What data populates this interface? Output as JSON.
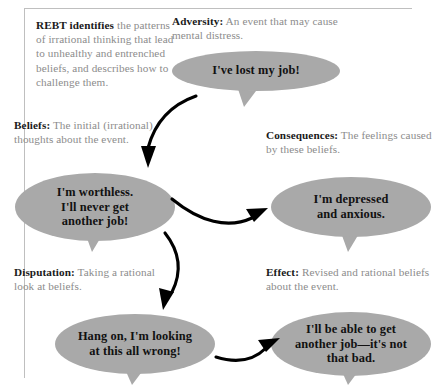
{
  "diagram": {
    "colors": {
      "bubble_fill": "#a9a9a9",
      "bubble_text": "#111111",
      "caption_lead": "#1a1a1a",
      "caption_body": "#8c8c8c",
      "arrow": "#000000",
      "rule": "#bfbfbf",
      "background": "#ffffff"
    },
    "intro": {
      "lead": "REBT identifies",
      "body": " the patterns of irrational thinking that lead to unhealthy and entrenched beliefs, and describes how to challenge them."
    },
    "steps": [
      {
        "key": "adversity",
        "lead": "Adversity:",
        "body": " An event that may cause mental distress.",
        "quote": "I've lost my job!"
      },
      {
        "key": "beliefs",
        "lead": "Beliefs:",
        "body": " The initial (irrational) thoughts about the event.",
        "quote": "I'm worthless. I'll never get another job!"
      },
      {
        "key": "consequences",
        "lead": "Consequences:",
        "body": " The feelings caused by these beliefs.",
        "quote": "I'm depressed and anxious."
      },
      {
        "key": "disputation",
        "lead": "Disputation:",
        "body": " Taking a rational look at beliefs.",
        "quote": "Hang on, I'm looking at this all wrong!"
      },
      {
        "key": "effect",
        "lead": "Effect:",
        "body": " Revised and rational beliefs about the event.",
        "quote": "I'll be able to get another job—it's not that bad."
      }
    ],
    "quote_lines": {
      "adversity": [
        "I've lost my job!"
      ],
      "beliefs": [
        "I'm worthless.",
        "I'll never get",
        "another job!"
      ],
      "consequences": [
        "I'm depressed",
        "and anxious."
      ],
      "disputation": [
        "Hang on, I'm looking",
        "at this all wrong!"
      ],
      "effect": [
        "I'll be able to get",
        "another job—it's not",
        "that bad."
      ]
    },
    "flow": [
      {
        "from": "adversity",
        "to": "beliefs"
      },
      {
        "from": "beliefs",
        "to": "consequences"
      },
      {
        "from": "consequences",
        "to": "disputation"
      },
      {
        "from": "disputation",
        "to": "effect"
      }
    ]
  }
}
